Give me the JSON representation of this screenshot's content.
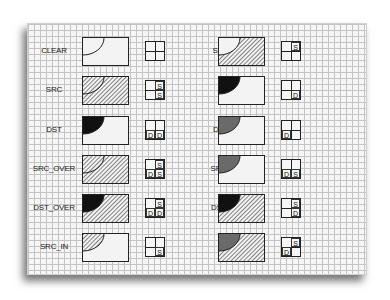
{
  "legend": {
    "S": "S",
    "D": "D"
  },
  "colors": {
    "dst": "#111111",
    "dst_dim": "#6a6a6a",
    "hatch": "#333333",
    "grid": "#c4c4c4",
    "paper": "#f6f6f6"
  },
  "rules": [
    {
      "name": "CLEAR",
      "col": 0,
      "row": 0,
      "src": false,
      "dst": "none",
      "overlap": "none",
      "quad": {
        "tl": "",
        "tr": "",
        "bl": "",
        "br": ""
      }
    },
    {
      "name": "SRC",
      "col": 0,
      "row": 1,
      "src": true,
      "dst": "none",
      "overlap": "src",
      "quad": {
        "tl": "",
        "tr": "S",
        "bl": "",
        "br": "S"
      }
    },
    {
      "name": "DST",
      "col": 0,
      "row": 2,
      "src": false,
      "dst": "solid",
      "overlap": "dst",
      "quad": {
        "tl": "",
        "tr": "",
        "bl": "D",
        "br": "D"
      }
    },
    {
      "name": "SRC_OVER",
      "col": 0,
      "row": 3,
      "src": true,
      "dst": "solid",
      "overlap": "src",
      "quad": {
        "tl": "",
        "tr": "S",
        "bl": "D",
        "br": "S"
      }
    },
    {
      "name": "DST_OVER",
      "col": 0,
      "row": 4,
      "src": true,
      "dst": "solid",
      "overlap": "dst",
      "quad": {
        "tl": "",
        "tr": "S",
        "bl": "D",
        "br": "D"
      }
    },
    {
      "name": "SRC_IN",
      "col": 0,
      "row": 5,
      "src": false,
      "dst": "none",
      "overlap": "src",
      "quad": {
        "tl": "",
        "tr": "",
        "bl": "",
        "br": "S"
      }
    },
    {
      "name": "SRC_OUT",
      "col": 1,
      "row": 0,
      "src": true,
      "dst": "none",
      "overlap": "clear",
      "quad": {
        "tl": "",
        "tr": "S",
        "bl": "",
        "br": ""
      }
    },
    {
      "name": "DST_IN",
      "col": 1,
      "row": 1,
      "src": false,
      "dst": "solid",
      "overlap": "dst",
      "quad": {
        "tl": "",
        "tr": "",
        "bl": "",
        "br": "D"
      }
    },
    {
      "name": "DST_OUT",
      "col": 1,
      "row": 2,
      "src": false,
      "dst": "dim",
      "overlap": "dst",
      "quad": {
        "tl": "",
        "tr": "",
        "bl": "D",
        "br": ""
      }
    },
    {
      "name": "SRC_ATOP",
      "col": 1,
      "row": 3,
      "src": false,
      "dst": "dim",
      "overlap": "dst",
      "quad": {
        "tl": "",
        "tr": "",
        "bl": "D",
        "br": "S"
      }
    },
    {
      "name": "DST_ATOP",
      "col": 1,
      "row": 4,
      "src": true,
      "dst": "solid",
      "overlap": "dst",
      "quad": {
        "tl": "",
        "tr": "S",
        "bl": "",
        "br": "D"
      }
    },
    {
      "name": "XOR",
      "col": 1,
      "row": 5,
      "src": true,
      "dst": "dim",
      "overlap": "dst",
      "quad": {
        "tl": "",
        "tr": "S",
        "bl": "D",
        "br": ""
      }
    }
  ]
}
